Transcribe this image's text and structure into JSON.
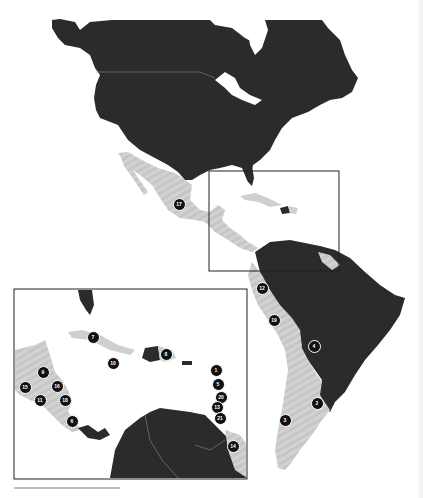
{
  "map": {
    "title": "",
    "colors": {
      "background": "#ffffff",
      "land_dark": "#2b2b2b",
      "land_highlight": "#cfcfcf",
      "border_line": "#8a8a8a",
      "marker_fill": "#111111",
      "marker_text": "#ffffff",
      "frame": "#222222"
    },
    "legend": {
      "highlighted_region": "Mexico, Central America, Caribbean & Andean South America",
      "dark_region": "Other land"
    },
    "main_markers": [
      {
        "id": "17",
        "x": 178,
        "y": 203
      },
      {
        "id": "12",
        "x": 261,
        "y": 287
      },
      {
        "id": "19",
        "x": 273,
        "y": 319
      },
      {
        "id": "4",
        "x": 313,
        "y": 345
      },
      {
        "id": "2",
        "x": 316,
        "y": 402
      },
      {
        "id": "3",
        "x": 284,
        "y": 419
      },
      {
        "id": "18",
        "x": 301,
        "y": 301
      }
    ],
    "inset": {
      "label": "Caribbean & Central America inset",
      "markers": [
        {
          "id": "7",
          "x": 92,
          "y": 336
        },
        {
          "id": "10",
          "x": 112,
          "y": 362
        },
        {
          "id": "8",
          "x": 165,
          "y": 353
        },
        {
          "id": "9",
          "x": 42,
          "y": 371
        },
        {
          "id": "15",
          "x": 24,
          "y": 386
        },
        {
          "id": "16",
          "x": 56,
          "y": 385
        },
        {
          "id": "11",
          "x": 39,
          "y": 399
        },
        {
          "id": "18",
          "x": 64,
          "y": 399
        },
        {
          "id": "6",
          "x": 71,
          "y": 420
        },
        {
          "id": "1",
          "x": 215,
          "y": 369
        },
        {
          "id": "5",
          "x": 217,
          "y": 383
        },
        {
          "id": "20",
          "x": 220,
          "y": 396
        },
        {
          "id": "13",
          "x": 216,
          "y": 406
        },
        {
          "id": "21",
          "x": 219,
          "y": 417
        },
        {
          "id": "14",
          "x": 232,
          "y": 445
        }
      ]
    },
    "focus_box": {
      "x": 209,
      "y": 171,
      "width": 130,
      "height": 100
    },
    "inset_box": {
      "x": 14,
      "y": 289,
      "width": 233,
      "height": 190
    }
  }
}
